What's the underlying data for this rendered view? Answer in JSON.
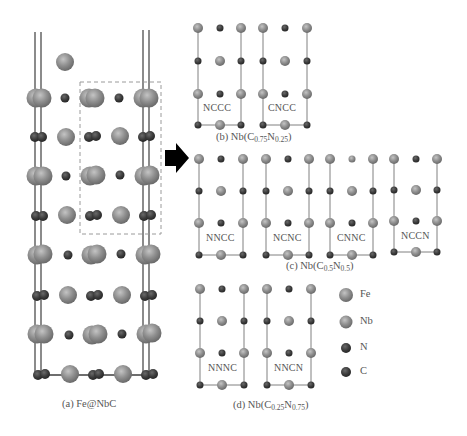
{
  "figure": {
    "type": "crystal-structure-diagram",
    "colors": {
      "Fe": "#8a8a8a",
      "Nb": "#9a9a9a",
      "N": "#3a3a3a",
      "C": "#4a4a4a",
      "bond": "#777777",
      "dashed_box": "#999999",
      "arrow": "#000000"
    }
  },
  "panel_a": {
    "caption": "(a) Fe@NbC"
  },
  "panel_b": {
    "caption_prefix": "(b) Nb(C",
    "c_sub": "0.75",
    "n_label": "N",
    "n_sub": "0.25",
    "caption_suffix": ")",
    "structures": [
      {
        "label": "NCCC"
      },
      {
        "label": "CNCC"
      }
    ]
  },
  "panel_c": {
    "caption_prefix": "(c) Nb(C",
    "c_sub": "0.5",
    "n_label": "N",
    "n_sub": "0.5",
    "caption_suffix": ")",
    "structures": [
      {
        "label": "NNCC"
      },
      {
        "label": "NCNC"
      },
      {
        "label": "CNNC"
      },
      {
        "label": "NCCN"
      }
    ]
  },
  "panel_d": {
    "caption_prefix": "(d) Nb(C",
    "c_sub": "0.25",
    "n_label": "N",
    "n_sub": "0.75",
    "caption_suffix": ")",
    "structures": [
      {
        "label": "NNNC"
      },
      {
        "label": "NNCN"
      }
    ]
  },
  "legend": {
    "items": [
      {
        "element": "Fe",
        "label": "Fe"
      },
      {
        "element": "Nb",
        "label": "Nb"
      },
      {
        "element": "N",
        "label": "N"
      },
      {
        "element": "C",
        "label": "C"
      }
    ]
  }
}
